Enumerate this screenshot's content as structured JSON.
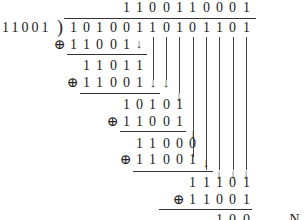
{
  "divisor": "11001",
  "dividend": [
    "1",
    "0",
    "1",
    "0",
    "0",
    "1",
    "1",
    "0",
    "1",
    "0",
    "1",
    "1",
    "0",
    "1"
  ],
  "quotient": [
    "1",
    "1",
    "0",
    "0",
    "1",
    "1",
    "0",
    "0",
    "0",
    "1"
  ],
  "xor_symbol": "⊕",
  "arrow_symbol": "↓",
  "steps": [
    {
      "xor_operand": [
        "1",
        "1",
        "0",
        "0",
        "1"
      ],
      "result": [
        "1",
        "1",
        "0",
        "1",
        "1"
      ]
    },
    {
      "xor_operand": [
        "1",
        "1",
        "0",
        "0",
        "1"
      ],
      "result": [
        "1",
        "0",
        "1",
        "0",
        "1"
      ]
    },
    {
      "xor_operand": [
        "1",
        "1",
        "0",
        "0",
        "1"
      ],
      "result": [
        "1",
        "1",
        "0",
        "0",
        "0"
      ]
    },
    {
      "xor_operand": [
        "1",
        "1",
        "0",
        "0",
        "1"
      ],
      "result": [
        "1",
        "1",
        "1",
        "0",
        "1"
      ]
    },
    {
      "xor_operand": [
        "1",
        "1",
        "0",
        "0",
        "1"
      ],
      "result": [
        "1",
        "0",
        "0"
      ]
    }
  ],
  "remainder_label": "→ N"
}
